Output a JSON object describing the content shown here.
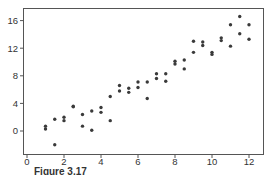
{
  "chart_data": {
    "type": "scatter",
    "title": "",
    "xlabel": "",
    "ylabel": "",
    "xlim": [
      -0.2,
      12.8
    ],
    "ylim": [
      -3.3,
      18.2
    ],
    "xticks": [
      0,
      2,
      4,
      6,
      8,
      10,
      12
    ],
    "yticks": [
      0,
      4,
      8,
      12,
      16
    ],
    "grid": false,
    "legend": null,
    "marker_color": "#3a3a3a",
    "series": [
      {
        "name": "data",
        "points": [
          [
            1.0,
            0.7
          ],
          [
            1.0,
            0.3
          ],
          [
            1.5,
            1.7
          ],
          [
            1.5,
            -2.0
          ],
          [
            2.0,
            2.0
          ],
          [
            2.0,
            1.5
          ],
          [
            2.5,
            3.6
          ],
          [
            2.5,
            3.5
          ],
          [
            3.0,
            2.4
          ],
          [
            3.0,
            0.7
          ],
          [
            3.5,
            2.9
          ],
          [
            3.5,
            0.1
          ],
          [
            4.0,
            3.4
          ],
          [
            4.0,
            2.7
          ],
          [
            4.5,
            5.0
          ],
          [
            4.5,
            1.5
          ],
          [
            5.0,
            6.6
          ],
          [
            5.0,
            5.8
          ],
          [
            5.5,
            6.2
          ],
          [
            5.5,
            5.6
          ],
          [
            6.0,
            7.1
          ],
          [
            6.0,
            6.3
          ],
          [
            6.5,
            7.1
          ],
          [
            6.5,
            4.7
          ],
          [
            7.0,
            8.3
          ],
          [
            7.0,
            7.6
          ],
          [
            7.5,
            8.3
          ],
          [
            7.5,
            7.2
          ],
          [
            8.0,
            10.1
          ],
          [
            8.0,
            9.7
          ],
          [
            8.5,
            10.3
          ],
          [
            8.5,
            9.0
          ],
          [
            9.0,
            13.0
          ],
          [
            9.0,
            11.4
          ],
          [
            9.5,
            12.9
          ],
          [
            9.5,
            12.4
          ],
          [
            10.0,
            11.4
          ],
          [
            10.0,
            11.1
          ],
          [
            10.5,
            13.5
          ],
          [
            10.5,
            13.1
          ],
          [
            11.0,
            15.4
          ],
          [
            11.0,
            12.3
          ],
          [
            11.5,
            16.6
          ],
          [
            11.5,
            14.1
          ],
          [
            12.0,
            15.4
          ],
          [
            12.0,
            13.3
          ]
        ]
      }
    ]
  },
  "caption": {
    "label": "Figure 3.17"
  }
}
